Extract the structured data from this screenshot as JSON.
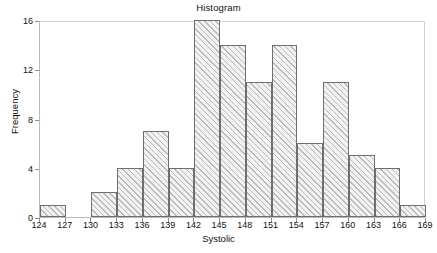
{
  "figure": {
    "title": "Histogram",
    "width": 437,
    "height": 253
  },
  "chart_data": {
    "type": "bar",
    "title": "Histogram",
    "xlabel": "Systolic",
    "ylabel": "Frequency",
    "bin_width": 3,
    "xlim": [
      124,
      169
    ],
    "ylim": [
      0,
      16
    ],
    "grid": false,
    "legend": null,
    "xticks": [
      124,
      127,
      130,
      133,
      136,
      139,
      142,
      145,
      148,
      151,
      154,
      157,
      160,
      163,
      166,
      169
    ],
    "yticks": [
      0,
      4,
      8,
      12,
      16
    ],
    "xtick_labels": [
      "124",
      "127",
      "130",
      "133",
      "136",
      "139",
      "142",
      "145",
      "148",
      "151",
      "154",
      "157",
      "160",
      "163",
      "166",
      "169"
    ],
    "ytick_labels": [
      "0",
      "4",
      "8",
      "12",
      "16"
    ],
    "bin_edges": [
      124,
      127,
      130,
      133,
      136,
      139,
      142,
      145,
      148,
      151,
      154,
      157,
      160,
      163,
      166,
      169
    ],
    "categories": [
      "124-127",
      "127-130",
      "130-133",
      "133-136",
      "136-139",
      "139-142",
      "142-145",
      "145-148",
      "148-151",
      "151-154",
      "154-157",
      "157-160",
      "160-163",
      "163-166",
      "166-169"
    ],
    "values": [
      1,
      0,
      2,
      4,
      7,
      4,
      16,
      14,
      11,
      14,
      6,
      11,
      5,
      4,
      1
    ],
    "total_count": 100
  },
  "style": {
    "bar_edge_color": "#6f6f6f",
    "bar_face_color": "#f2f2f2",
    "hatch": "diagonal",
    "frame_color": "#d2d2d2",
    "axis_color": "#b9b9b9",
    "text_color": "#111111"
  }
}
